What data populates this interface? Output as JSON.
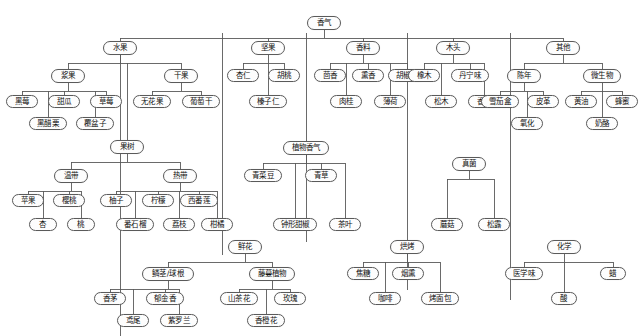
{
  "diagram": {
    "title": "香气",
    "type": "hierarchy-tree",
    "node_border_color": "#5a5a5a",
    "node_fill_color": "#fdfdfd",
    "edge_color": "#5a5a5a"
  },
  "nodes": [
    {
      "id": "root",
      "label": "香气",
      "x": 307,
      "y": 16,
      "w": 34,
      "h": 14
    },
    {
      "id": "fruit",
      "label": "水果",
      "x": 103,
      "y": 41,
      "w": 34,
      "h": 14
    },
    {
      "id": "berry",
      "label": "浆果",
      "x": 51,
      "y": 69,
      "w": 34,
      "h": 14
    },
    {
      "id": "blackberry",
      "label": "黑莓",
      "x": 6,
      "y": 95,
      "w": 32,
      "h": 13
    },
    {
      "id": "melon",
      "label": "甜瓜",
      "x": 48,
      "y": 95,
      "w": 32,
      "h": 13
    },
    {
      "id": "strawberry",
      "label": "草莓",
      "x": 90,
      "y": 95,
      "w": 32,
      "h": 13
    },
    {
      "id": "blackcurrant",
      "label": "黑醋栗",
      "x": 29,
      "y": 117,
      "w": 38,
      "h": 13
    },
    {
      "id": "raspberry",
      "label": "覆盆子",
      "x": 76,
      "y": 117,
      "w": 38,
      "h": 13
    },
    {
      "id": "driedfruit",
      "label": "干果",
      "x": 164,
      "y": 69,
      "w": 34,
      "h": 14
    },
    {
      "id": "fig",
      "label": "无花果",
      "x": 133,
      "y": 95,
      "w": 38,
      "h": 13
    },
    {
      "id": "raisin",
      "label": "葡萄干",
      "x": 182,
      "y": 95,
      "w": 38,
      "h": 13
    },
    {
      "id": "fruittree",
      "label": "果树",
      "x": 110,
      "y": 140,
      "w": 34,
      "h": 14
    },
    {
      "id": "temperate",
      "label": "温带",
      "x": 54,
      "y": 169,
      "w": 34,
      "h": 14
    },
    {
      "id": "apple",
      "label": "苹果",
      "x": 12,
      "y": 194,
      "w": 32,
      "h": 13
    },
    {
      "id": "cherry",
      "label": "樱桃",
      "x": 53,
      "y": 194,
      "w": 32,
      "h": 13
    },
    {
      "id": "apricot",
      "label": "杏",
      "x": 29,
      "y": 218,
      "w": 28,
      "h": 13
    },
    {
      "id": "peach",
      "label": "桃",
      "x": 67,
      "y": 218,
      "w": 28,
      "h": 13
    },
    {
      "id": "tropical",
      "label": "热带",
      "x": 163,
      "y": 169,
      "w": 34,
      "h": 14
    },
    {
      "id": "pomelo",
      "label": "柚子",
      "x": 100,
      "y": 194,
      "w": 32,
      "h": 13
    },
    {
      "id": "lemon",
      "label": "柠檬",
      "x": 142,
      "y": 194,
      "w": 32,
      "h": 13
    },
    {
      "id": "passionfruit",
      "label": "西番莲",
      "x": 180,
      "y": 194,
      "w": 38,
      "h": 13
    },
    {
      "id": "guava",
      "label": "番石榴",
      "x": 116,
      "y": 218,
      "w": 38,
      "h": 13
    },
    {
      "id": "lychee",
      "label": "荔枝",
      "x": 163,
      "y": 218,
      "w": 32,
      "h": 13
    },
    {
      "id": "citrus",
      "label": "柑橘",
      "x": 201,
      "y": 218,
      "w": 32,
      "h": 13
    },
    {
      "id": "flower",
      "label": "鲜花",
      "x": 228,
      "y": 240,
      "w": 34,
      "h": 14
    },
    {
      "id": "bulb",
      "label": "鳞茎/球根",
      "x": 142,
      "y": 267,
      "w": 52,
      "h": 14
    },
    {
      "id": "lemongrass",
      "label": "香茅",
      "x": 94,
      "y": 292,
      "w": 32,
      "h": 13
    },
    {
      "id": "tulip",
      "label": "郁金香",
      "x": 146,
      "y": 292,
      "w": 38,
      "h": 13
    },
    {
      "id": "iris",
      "label": "鸢尾",
      "x": 117,
      "y": 314,
      "w": 32,
      "h": 13
    },
    {
      "id": "violet",
      "label": "紫罗兰",
      "x": 160,
      "y": 314,
      "w": 38,
      "h": 13
    },
    {
      "id": "vine",
      "label": "藤蔓植物",
      "x": 249,
      "y": 267,
      "w": 46,
      "h": 14
    },
    {
      "id": "camellia",
      "label": "山茶花",
      "x": 220,
      "y": 292,
      "w": 38,
      "h": 13
    },
    {
      "id": "rose",
      "label": "玫瑰",
      "x": 274,
      "y": 292,
      "w": 32,
      "h": 13
    },
    {
      "id": "orangeblossom",
      "label": "香橙花",
      "x": 247,
      "y": 314,
      "w": 38,
      "h": 13
    },
    {
      "id": "nuts",
      "label": "坚果",
      "x": 251,
      "y": 41,
      "w": 34,
      "h": 14
    },
    {
      "id": "almond",
      "label": "杏仁",
      "x": 227,
      "y": 69,
      "w": 32,
      "h": 13
    },
    {
      "id": "walnut",
      "label": "胡桃",
      "x": 268,
      "y": 69,
      "w": 32,
      "h": 13
    },
    {
      "id": "hazelnut",
      "label": "榛子仁",
      "x": 249,
      "y": 95,
      "w": 38,
      "h": 13
    },
    {
      "id": "plantaroma",
      "label": "植物香气",
      "x": 283,
      "y": 141,
      "w": 46,
      "h": 14
    },
    {
      "id": "greenbean",
      "label": "青菜豆",
      "x": 244,
      "y": 169,
      "w": 38,
      "h": 13
    },
    {
      "id": "grass",
      "label": "青草",
      "x": 305,
      "y": 169,
      "w": 32,
      "h": 13
    },
    {
      "id": "bellpepper",
      "label": "钟形甜椒",
      "x": 273,
      "y": 218,
      "w": 44,
      "h": 13
    },
    {
      "id": "tealeaf",
      "label": "茶叶",
      "x": 329,
      "y": 218,
      "w": 32,
      "h": 13
    },
    {
      "id": "spice",
      "label": "香料",
      "x": 346,
      "y": 41,
      "w": 34,
      "h": 14
    },
    {
      "id": "fennel",
      "label": "茴香",
      "x": 314,
      "y": 69,
      "w": 32,
      "h": 13
    },
    {
      "id": "incense",
      "label": "熏香",
      "x": 352,
      "y": 69,
      "w": 32,
      "h": 13
    },
    {
      "id": "pepper",
      "label": "胡椒粉",
      "x": 388,
      "y": 69,
      "w": 38,
      "h": 13
    },
    {
      "id": "cinnamon",
      "label": "肉桂",
      "x": 330,
      "y": 95,
      "w": 32,
      "h": 13
    },
    {
      "id": "mint",
      "label": "薄荷",
      "x": 374,
      "y": 95,
      "w": 32,
      "h": 13
    },
    {
      "id": "wood",
      "label": "木头",
      "x": 436,
      "y": 41,
      "w": 34,
      "h": 14
    },
    {
      "id": "oak",
      "label": "橡木",
      "x": 408,
      "y": 69,
      "w": 32,
      "h": 13
    },
    {
      "id": "tannin",
      "label": "丹宁味",
      "x": 451,
      "y": 69,
      "w": 38,
      "h": 13
    },
    {
      "id": "pine",
      "label": "松木",
      "x": 425,
      "y": 95,
      "w": 32,
      "h": 13
    },
    {
      "id": "vanilla",
      "label": "香草",
      "x": 468,
      "y": 95,
      "w": 32,
      "h": 13
    },
    {
      "id": "fungi",
      "label": "真菌",
      "x": 452,
      "y": 157,
      "w": 34,
      "h": 14
    },
    {
      "id": "mushroom",
      "label": "蘑菇",
      "x": 431,
      "y": 218,
      "w": 32,
      "h": 13
    },
    {
      "id": "truffle",
      "label": "松露",
      "x": 478,
      "y": 218,
      "w": 32,
      "h": 13
    },
    {
      "id": "roasted",
      "label": "烘烤",
      "x": 390,
      "y": 240,
      "w": 34,
      "h": 14
    },
    {
      "id": "caramel",
      "label": "焦糖",
      "x": 347,
      "y": 267,
      "w": 32,
      "h": 13
    },
    {
      "id": "smoke",
      "label": "烟熏",
      "x": 392,
      "y": 267,
      "w": 32,
      "h": 13
    },
    {
      "id": "coffee",
      "label": "咖啡",
      "x": 369,
      "y": 292,
      "w": 32,
      "h": 13
    },
    {
      "id": "toast",
      "label": "烤面包",
      "x": 421,
      "y": 292,
      "w": 38,
      "h": 13
    },
    {
      "id": "other",
      "label": "其他",
      "x": 546,
      "y": 41,
      "w": 34,
      "h": 14
    },
    {
      "id": "aged",
      "label": "陈年",
      "x": 507,
      "y": 69,
      "w": 34,
      "h": 14
    },
    {
      "id": "cigarbox",
      "label": "雪茄盒",
      "x": 481,
      "y": 95,
      "w": 38,
      "h": 13
    },
    {
      "id": "leather",
      "label": "皮革",
      "x": 527,
      "y": 95,
      "w": 32,
      "h": 13
    },
    {
      "id": "oxidized",
      "label": "氧化",
      "x": 511,
      "y": 117,
      "w": 32,
      "h": 13
    },
    {
      "id": "microbial",
      "label": "微生物",
      "x": 583,
      "y": 69,
      "w": 38,
      "h": 14
    },
    {
      "id": "butter",
      "label": "黄油",
      "x": 565,
      "y": 95,
      "w": 32,
      "h": 13
    },
    {
      "id": "honey",
      "label": "蜂蜜",
      "x": 606,
      "y": 95,
      "w": 32,
      "h": 13
    },
    {
      "id": "cheese",
      "label": "奶酪",
      "x": 586,
      "y": 117,
      "w": 32,
      "h": 13
    },
    {
      "id": "chemical",
      "label": "化学",
      "x": 547,
      "y": 240,
      "w": 34,
      "h": 14
    },
    {
      "id": "medicinal",
      "label": "医学味",
      "x": 505,
      "y": 267,
      "w": 38,
      "h": 13
    },
    {
      "id": "wax",
      "label": "蜡",
      "x": 600,
      "y": 267,
      "w": 26,
      "h": 13
    },
    {
      "id": "acid",
      "label": "酸",
      "x": 551,
      "y": 292,
      "w": 26,
      "h": 13
    }
  ],
  "edges": [
    {
      "from": "root",
      "to": "fruit"
    },
    {
      "from": "root",
      "to": "nuts"
    },
    {
      "from": "root",
      "to": "spice"
    },
    {
      "from": "root",
      "to": "wood"
    },
    {
      "from": "root",
      "to": "other"
    },
    {
      "from": "fruit",
      "to": "berry"
    },
    {
      "from": "fruit",
      "to": "driedfruit"
    },
    {
      "from": "fruit",
      "to": "fruittree"
    },
    {
      "from": "berry",
      "to": "blackberry"
    },
    {
      "from": "berry",
      "to": "melon"
    },
    {
      "from": "berry",
      "to": "strawberry"
    },
    {
      "from": "berry",
      "to": "blackcurrant"
    },
    {
      "from": "berry",
      "to": "raspberry"
    },
    {
      "from": "driedfruit",
      "to": "fig"
    },
    {
      "from": "driedfruit",
      "to": "raisin"
    },
    {
      "from": "fruittree",
      "to": "temperate"
    },
    {
      "from": "fruittree",
      "to": "tropical"
    },
    {
      "from": "temperate",
      "to": "apple"
    },
    {
      "from": "temperate",
      "to": "cherry"
    },
    {
      "from": "temperate",
      "to": "apricot"
    },
    {
      "from": "temperate",
      "to": "peach"
    },
    {
      "from": "tropical",
      "to": "pomelo"
    },
    {
      "from": "tropical",
      "to": "lemon"
    },
    {
      "from": "tropical",
      "to": "passionfruit"
    },
    {
      "from": "tropical",
      "to": "guava"
    },
    {
      "from": "tropical",
      "to": "lychee"
    },
    {
      "from": "tropical",
      "to": "citrus"
    },
    {
      "from": "flower",
      "to": "bulb"
    },
    {
      "from": "flower",
      "to": "vine"
    },
    {
      "from": "bulb",
      "to": "lemongrass"
    },
    {
      "from": "bulb",
      "to": "tulip"
    },
    {
      "from": "bulb",
      "to": "iris"
    },
    {
      "from": "bulb",
      "to": "violet"
    },
    {
      "from": "vine",
      "to": "camellia"
    },
    {
      "from": "vine",
      "to": "rose"
    },
    {
      "from": "vine",
      "to": "orangeblossom"
    },
    {
      "from": "nuts",
      "to": "almond"
    },
    {
      "from": "nuts",
      "to": "walnut"
    },
    {
      "from": "nuts",
      "to": "hazelnut"
    },
    {
      "from": "plantaroma",
      "to": "greenbean"
    },
    {
      "from": "plantaroma",
      "to": "grass"
    },
    {
      "from": "plantaroma",
      "to": "bellpepper"
    },
    {
      "from": "plantaroma",
      "to": "tealeaf"
    },
    {
      "from": "spice",
      "to": "fennel"
    },
    {
      "from": "spice",
      "to": "incense"
    },
    {
      "from": "spice",
      "to": "pepper"
    },
    {
      "from": "spice",
      "to": "cinnamon"
    },
    {
      "from": "spice",
      "to": "mint"
    },
    {
      "from": "wood",
      "to": "oak"
    },
    {
      "from": "wood",
      "to": "tannin"
    },
    {
      "from": "wood",
      "to": "pine"
    },
    {
      "from": "wood",
      "to": "vanilla"
    },
    {
      "from": "fungi",
      "to": "mushroom"
    },
    {
      "from": "fungi",
      "to": "truffle"
    },
    {
      "from": "roasted",
      "to": "caramel"
    },
    {
      "from": "roasted",
      "to": "smoke"
    },
    {
      "from": "roasted",
      "to": "coffee"
    },
    {
      "from": "roasted",
      "to": "toast"
    },
    {
      "from": "other",
      "to": "aged"
    },
    {
      "from": "other",
      "to": "microbial"
    },
    {
      "from": "aged",
      "to": "cigarbox"
    },
    {
      "from": "aged",
      "to": "leather"
    },
    {
      "from": "aged",
      "to": "oxidized"
    },
    {
      "from": "microbial",
      "to": "butter"
    },
    {
      "from": "microbial",
      "to": "honey"
    },
    {
      "from": "microbial",
      "to": "cheese"
    },
    {
      "from": "chemical",
      "to": "medicinal"
    },
    {
      "from": "chemical",
      "to": "wax"
    },
    {
      "from": "chemical",
      "to": "acid"
    }
  ],
  "trunks": [
    {
      "name": "fruit-trunk",
      "x": 120,
      "y1": 55,
      "y2": 336
    },
    {
      "name": "nuts-trunk",
      "x": 222,
      "y1": 33,
      "y2": 255
    },
    {
      "name": "spice-trunk",
      "x": 306,
      "y1": 33,
      "y2": 242
    },
    {
      "name": "wood-trunk",
      "x": 407,
      "y1": 33,
      "y2": 290
    },
    {
      "name": "other-trunk",
      "x": 510,
      "y1": 33,
      "y2": 300
    }
  ]
}
